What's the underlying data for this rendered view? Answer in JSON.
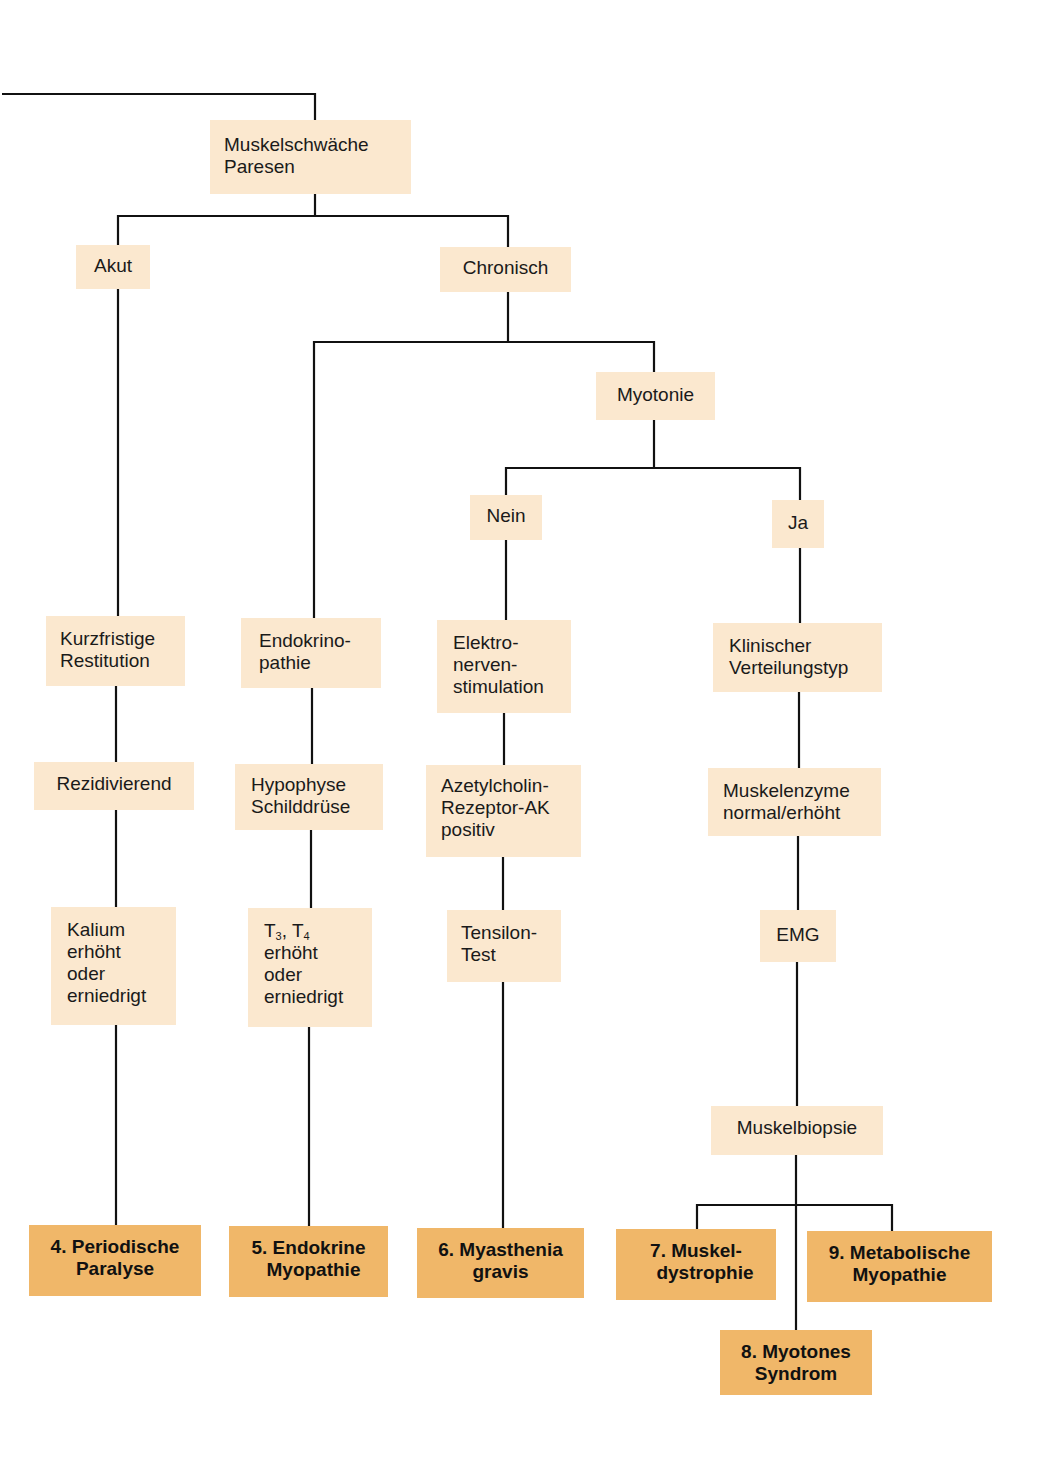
{
  "diagram": {
    "type": "flowchart",
    "topic": "Muskelschwäche Paresen – Differentialdiagnose",
    "colors": {
      "node_fill": "#fbe8cf",
      "result_fill": "#f0b769",
      "line": "#111111",
      "text": "#1a1a1a"
    },
    "nodes": {
      "root": {
        "lines": [
          "Muskelschwäche",
          "Paresen"
        ]
      },
      "akut": {
        "lines": [
          "Akut"
        ]
      },
      "chronisch": {
        "lines": [
          "Chronisch"
        ]
      },
      "myotonie": {
        "lines": [
          "Myotonie"
        ]
      },
      "nein": {
        "lines": [
          "Nein"
        ]
      },
      "ja": {
        "lines": [
          "Ja"
        ]
      },
      "kurzfristige": {
        "lines": [
          "Kurzfristige",
          "Restitution"
        ]
      },
      "endokrinopathie": {
        "lines": [
          "Endokrino-",
          "pathie"
        ]
      },
      "elektro": {
        "lines": [
          "Elektro-",
          "nerven-",
          "stimulation"
        ]
      },
      "klinischer": {
        "lines": [
          "Klinischer",
          "Verteilungstyp"
        ]
      },
      "rezidivierend": {
        "lines": [
          "Rezidivierend"
        ]
      },
      "hypophyse": {
        "lines": [
          "Hypophyse",
          "Schilddrüse"
        ]
      },
      "azetylcholin": {
        "lines": [
          "Azetylcholin-",
          "Rezeptor-AK",
          "positiv"
        ]
      },
      "muskelenzyme": {
        "lines": [
          "Muskelenzyme",
          "normal/erhöht"
        ]
      },
      "kalium": {
        "lines": [
          "Kalium",
          "erhöht",
          "oder",
          "erniedrigt"
        ]
      },
      "t3t4": {
        "t": "T",
        "sub3": "3",
        "sep": ", T",
        "sub4": "4",
        "lines": [
          "erhöht",
          "oder",
          "erniedrigt"
        ]
      },
      "tensilon": {
        "lines": [
          "Tensilon-",
          "Test"
        ]
      },
      "emg": {
        "lines": [
          "EMG"
        ]
      },
      "muskelbiopsie": {
        "lines": [
          "Muskelbiopsie"
        ]
      }
    },
    "results": [
      {
        "id": "r4",
        "lines": [
          "4. Periodische",
          "Paralyse"
        ]
      },
      {
        "id": "r5",
        "lines": [
          "5. Endokrine",
          "Myopathie"
        ]
      },
      {
        "id": "r6",
        "lines": [
          "6. Myasthenia",
          "gravis"
        ]
      },
      {
        "id": "r7",
        "lines": [
          "7. Muskel-",
          "dystrophie"
        ]
      },
      {
        "id": "r8",
        "lines": [
          "8. Myotones",
          "Syndrom"
        ]
      },
      {
        "id": "r9",
        "lines": [
          "9. Metabolische",
          "Myopathie"
        ]
      }
    ],
    "edges": [
      [
        "incoming",
        "root"
      ],
      [
        "root",
        "akut"
      ],
      [
        "root",
        "chronisch"
      ],
      [
        "chronisch",
        "endokrinopathie"
      ],
      [
        "chronisch",
        "myotonie"
      ],
      [
        "myotonie",
        "nein"
      ],
      [
        "myotonie",
        "ja"
      ],
      [
        "akut",
        "kurzfristige"
      ],
      [
        "kurzfristige",
        "rezidivierend"
      ],
      [
        "rezidivierend",
        "kalium"
      ],
      [
        "kalium",
        "r4"
      ],
      [
        "endokrinopathie",
        "hypophyse"
      ],
      [
        "hypophyse",
        "t3t4"
      ],
      [
        "t3t4",
        "r5"
      ],
      [
        "nein",
        "elektro"
      ],
      [
        "elektro",
        "azetylcholin"
      ],
      [
        "azetylcholin",
        "tensilon"
      ],
      [
        "tensilon",
        "r6"
      ],
      [
        "ja",
        "klinischer"
      ],
      [
        "klinischer",
        "muskelenzyme"
      ],
      [
        "muskelenzyme",
        "emg"
      ],
      [
        "emg",
        "muskelbiopsie"
      ],
      [
        "muskelbiopsie",
        "r7"
      ],
      [
        "muskelbiopsie",
        "r8"
      ],
      [
        "muskelbiopsie",
        "r9"
      ]
    ]
  }
}
